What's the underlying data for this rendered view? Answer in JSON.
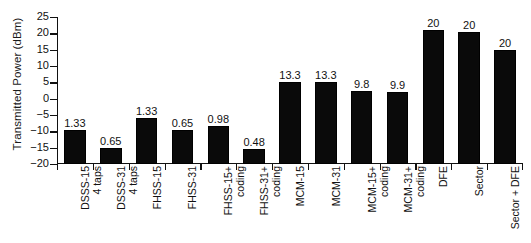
{
  "chart_data": {
    "type": "bar",
    "title": "",
    "xlabel": "",
    "ylabel": "Transmitted Power (dBm)",
    "ylim": [
      -20,
      25
    ],
    "ytick_step": 5,
    "yticks": [
      25,
      20,
      15,
      10,
      5,
      0,
      -5,
      -10,
      -15,
      -20
    ],
    "ytick_labels": [
      "25",
      "20",
      "15",
      "10",
      "5",
      "0",
      "−5",
      "−10",
      "−15",
      "−20"
    ],
    "grid": false,
    "legend": null,
    "bar_color": "#0a0a0a",
    "categories": [
      "DSSS-15\n4 taps",
      "DSSS-31\n4 taps",
      "FHSS-15",
      "FHSS-31",
      "FHSS-15+\ncoding",
      "FHSS-31+\ncoding",
      "MCM-15",
      "MCM-31",
      "MCM-15+\ncoding",
      "MCM-31+\ncoding",
      "DFE",
      "Sector",
      "Sector + DFE"
    ],
    "values": [
      -9.5,
      -15.0,
      -6.0,
      -9.5,
      -8.5,
      -15.5,
      5.0,
      5.0,
      2.5,
      2.0,
      21.0,
      20.5,
      15.0
    ],
    "data_labels": [
      "1.33",
      "0.65",
      "1.33",
      "0.65",
      "0.98",
      "0.48",
      "13.3",
      "13.3",
      "9.8",
      "9.9",
      "20",
      "20",
      "20"
    ]
  },
  "axis": {
    "y_title": "Transmitted Power (dBm)"
  },
  "bars": [
    {
      "label_line1": "DSSS-15",
      "label_line2": "4 taps",
      "value_label": "1.33",
      "value": -9.5
    },
    {
      "label_line1": "DSSS-31",
      "label_line2": "4 taps",
      "value_label": "0.65",
      "value": -15.0
    },
    {
      "label_line1": "FHSS-15",
      "label_line2": "",
      "value_label": "1.33",
      "value": -6.0
    },
    {
      "label_line1": "FHSS-31",
      "label_line2": "",
      "value_label": "0.65",
      "value": -9.5
    },
    {
      "label_line1": "FHSS-15+",
      "label_line2": "coding",
      "value_label": "0.98",
      "value": -8.5
    },
    {
      "label_line1": "FHSS-31+",
      "label_line2": "coding",
      "value_label": "0.48",
      "value": -15.5
    },
    {
      "label_line1": "MCM-15",
      "label_line2": "",
      "value_label": "13.3",
      "value": 5.0
    },
    {
      "label_line1": "MCM-31",
      "label_line2": "",
      "value_label": "13.3",
      "value": 5.0
    },
    {
      "label_line1": "MCM-15+",
      "label_line2": "coding",
      "value_label": "9.8",
      "value": 2.5
    },
    {
      "label_line1": "MCM-31+",
      "label_line2": "coding",
      "value_label": "9.9",
      "value": 2.0
    },
    {
      "label_line1": "DFE",
      "label_line2": "",
      "value_label": "20",
      "value": 21.0
    },
    {
      "label_line1": "Sector",
      "label_line2": "",
      "value_label": "20",
      "value": 20.5
    },
    {
      "label_line1": "Sector + DFE",
      "label_line2": "",
      "value_label": "20",
      "value": 15.0
    }
  ]
}
